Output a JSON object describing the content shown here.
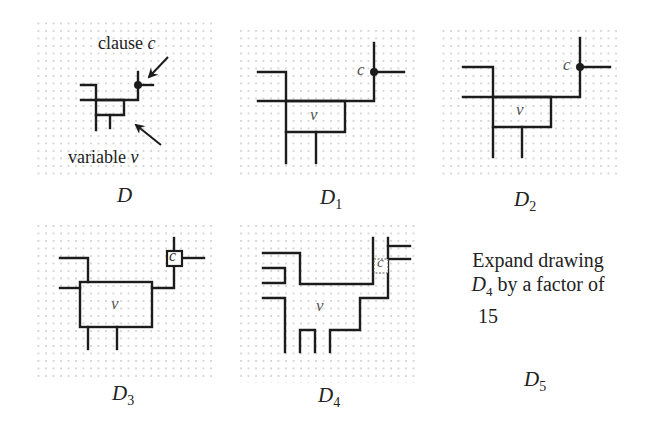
{
  "figure": {
    "panels": [
      {
        "id": "D",
        "caption": "D",
        "sub": ""
      },
      {
        "id": "D1",
        "caption": "D",
        "sub": "1"
      },
      {
        "id": "D2",
        "caption": "D",
        "sub": "2"
      },
      {
        "id": "D3",
        "caption": "D",
        "sub": "3"
      },
      {
        "id": "D4",
        "caption": "D",
        "sub": "4"
      },
      {
        "id": "D5",
        "caption": "D",
        "sub": "5"
      }
    ],
    "annotations": {
      "clause_text": "clause ",
      "clause_var": "c",
      "variable_text": "variable ",
      "variable_var": "v"
    },
    "node_labels": {
      "variable": "v",
      "clause": "c"
    },
    "expand_note": {
      "line1": "Expand drawing",
      "line2_var": "D",
      "line2_sub": "4",
      "line2_rest": " by a factor of",
      "line3": "15"
    },
    "colors": {
      "line": "#1c1c1c",
      "grid_dot": "#9a9a9a",
      "background": "#ffffff"
    }
  }
}
